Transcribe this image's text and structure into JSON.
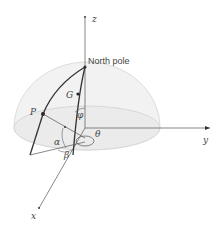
{
  "diagram": {
    "labels": {
      "z_axis": "z",
      "y_axis": "y",
      "x_axis": "x",
      "north_pole": "North pole",
      "point_p": "P",
      "point_g": "G",
      "angle_phi": "φ",
      "angle_theta": "θ",
      "angle_alpha": "α",
      "angle_beta": "β"
    },
    "colors": {
      "line": "#333333",
      "axis": "#555555",
      "hemisphere_fill": "#f0f0f0",
      "hemisphere_edge": "#d8d8d8",
      "text": "#444444"
    }
  }
}
